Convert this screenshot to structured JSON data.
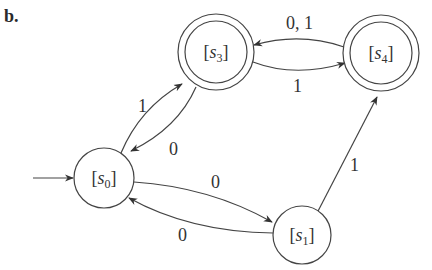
{
  "figure_label": "b.",
  "diagram": {
    "type": "finite-state-automaton",
    "start_state": "s0",
    "states": [
      {
        "id": "s0",
        "label_prefix": "[",
        "label_var": "s",
        "label_sub": "0",
        "label_suffix": "]",
        "accepting": false,
        "cx": 104,
        "cy": 178
      },
      {
        "id": "s1",
        "label_prefix": "[",
        "label_var": "s",
        "label_sub": "1",
        "label_suffix": "]",
        "accepting": false,
        "cx": 302,
        "cy": 235
      },
      {
        "id": "s3",
        "label_prefix": "[",
        "label_var": "s",
        "label_sub": "3",
        "label_suffix": "]",
        "accepting": true,
        "cx": 216,
        "cy": 52
      },
      {
        "id": "s4",
        "label_prefix": "[",
        "label_var": "s",
        "label_sub": "4",
        "label_suffix": "]",
        "accepting": true,
        "cx": 381,
        "cy": 53
      }
    ],
    "transitions": [
      {
        "from": "s0",
        "to": "s3",
        "label": "1"
      },
      {
        "from": "s3",
        "to": "s0",
        "label": "0"
      },
      {
        "from": "s0",
        "to": "s1",
        "label": "0"
      },
      {
        "from": "s1",
        "to": "s0",
        "label": "0"
      },
      {
        "from": "s1",
        "to": "s4",
        "label": "1"
      },
      {
        "from": "s3",
        "to": "s4",
        "label": "1"
      },
      {
        "from": "s4",
        "to": "s3",
        "label": "0, 1"
      }
    ]
  }
}
